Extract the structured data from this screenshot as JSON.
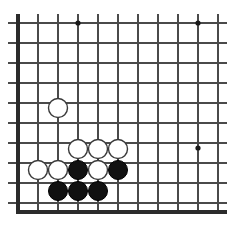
{
  "figure": {
    "board_background_color": "#ffffff",
    "line_color": "#4a4a4a",
    "edge_line_color": "#2b2b2b",
    "black_stone_color": "#111111",
    "white_stone_color": "#ffffff",
    "white_stone_outline_color": "#3a3a3a",
    "star_point_color": "#1a1a1a"
  },
  "board": {
    "cell_size": 20,
    "stone_radius": 9.5,
    "star_radius": 2.6,
    "origin_x": 18,
    "origin_y": 23,
    "left_edge_x": 18,
    "bottom_edge_y": 212,
    "top_line_y": 23,
    "vertical_lines_x": [
      18,
      38,
      58,
      78,
      98,
      118,
      138,
      158,
      178,
      198,
      218
    ],
    "vertical_line_top_y": 14,
    "vertical_line_bottom_y": 212,
    "horizontal_lines_y": [
      23,
      43,
      63,
      83,
      103,
      123,
      143,
      163,
      183,
      203
    ],
    "horizontal_line_left_x": 8,
    "horizontal_line_right_x": 227,
    "columns": 11,
    "rows": 10
  },
  "star_points": [
    {
      "name": "star-point-top-left",
      "x": 78,
      "y": 23
    },
    {
      "name": "star-point-top-right",
      "x": 198,
      "y": 23
    },
    {
      "name": "star-point-right-side",
      "x": 198,
      "y": 148
    }
  ],
  "stones": [
    {
      "name": "white-stone-lone",
      "color": "white",
      "x": 58,
      "y": 108
    },
    {
      "name": "white-stone-upper-a",
      "color": "white",
      "x": 78,
      "y": 149
    },
    {
      "name": "white-stone-upper-b",
      "color": "white",
      "x": 98,
      "y": 149
    },
    {
      "name": "white-stone-upper-c",
      "color": "white",
      "x": 118,
      "y": 149
    },
    {
      "name": "white-stone-left-a",
      "color": "white",
      "x": 38,
      "y": 170
    },
    {
      "name": "white-stone-left-b",
      "color": "white",
      "x": 58,
      "y": 170
    },
    {
      "name": "black-stone-mid-a",
      "color": "black",
      "x": 78,
      "y": 170
    },
    {
      "name": "white-stone-mid-center",
      "color": "white",
      "x": 98,
      "y": 170
    },
    {
      "name": "black-stone-mid-b",
      "color": "black",
      "x": 118,
      "y": 170
    },
    {
      "name": "black-stone-lower-a",
      "color": "black",
      "x": 58,
      "y": 191
    },
    {
      "name": "black-stone-lower-b",
      "color": "black",
      "x": 78,
      "y": 191
    },
    {
      "name": "black-stone-lower-c",
      "color": "black",
      "x": 98,
      "y": 191
    }
  ],
  "counts": {
    "black_stones": 5,
    "white_stones": 7,
    "total_stones": 12,
    "star_points": 3
  }
}
